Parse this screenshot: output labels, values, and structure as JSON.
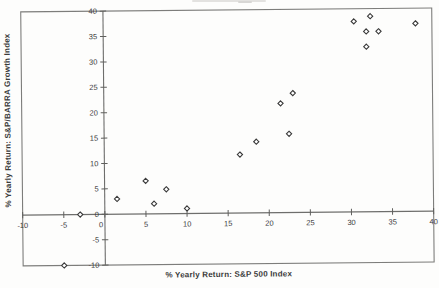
{
  "figure": {
    "xlabel": "% Yearly Return: S&P 500 Index",
    "ylabel": "% Yearly Return: S&P/BARRA Growth Index"
  },
  "chart_data": {
    "type": "scatter",
    "title": "",
    "xlabel": "% Yearly Return: S&P 500 Index",
    "ylabel": "% Yearly Return: S&P/BARRA Growth Index",
    "xlim": [
      -10,
      40
    ],
    "ylim": [
      -10,
      40
    ],
    "x_ticks": [
      -10,
      -5,
      0,
      5,
      10,
      15,
      20,
      25,
      30,
      35,
      40
    ],
    "y_ticks": [
      -10,
      -5,
      0,
      5,
      10,
      15,
      20,
      25,
      30,
      35,
      40
    ],
    "grid": false,
    "legend": "none",
    "marker": "diamond-outline",
    "colors": {
      "border": "#7d7d7b",
      "axis": "#6e6e6c",
      "tick": "#5f5f5d",
      "marker_stroke": "#3a3a3a",
      "marker_fill": "#ffffff",
      "text": "#3c3c3c",
      "background": "#fdfdfc"
    },
    "points": [
      {
        "x": -5,
        "y": -10
      },
      {
        "x": -3,
        "y": 0
      },
      {
        "x": 1.5,
        "y": 3
      },
      {
        "x": 5,
        "y": 6.5
      },
      {
        "x": 6,
        "y": 2
      },
      {
        "x": 7.5,
        "y": 4.8
      },
      {
        "x": 10,
        "y": 1
      },
      {
        "x": 16.5,
        "y": 11.5
      },
      {
        "x": 18.5,
        "y": 14
      },
      {
        "x": 21.5,
        "y": 21.5
      },
      {
        "x": 22.5,
        "y": 15.5
      },
      {
        "x": 23,
        "y": 23.5
      },
      {
        "x": 30.5,
        "y": 37.5
      },
      {
        "x": 32,
        "y": 32.5
      },
      {
        "x": 32,
        "y": 35.5
      },
      {
        "x": 32.5,
        "y": 38.5
      },
      {
        "x": 33.5,
        "y": 35.5
      },
      {
        "x": 38,
        "y": 37
      }
    ]
  }
}
